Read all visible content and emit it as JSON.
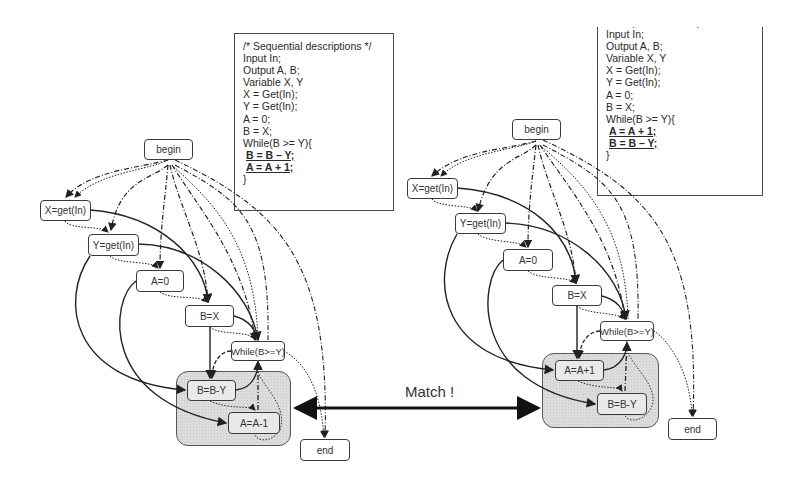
{
  "left": {
    "code": {
      "lines": [
        {
          "text": "/* Sequential descriptions */",
          "highlight": false
        },
        {
          "text": "Input In;",
          "highlight": false
        },
        {
          "text": "Output A, B;",
          "highlight": false
        },
        {
          "text": "Variable X, Y",
          "highlight": false
        },
        {
          "text": "X = Get(In);",
          "highlight": false
        },
        {
          "text": "Y = Get(In);",
          "highlight": false
        },
        {
          "text": "A = 0;",
          "highlight": false
        },
        {
          "text": "B = X;",
          "highlight": false
        },
        {
          "text": "While(B >= Y){",
          "highlight": false
        },
        {
          "text": "B = B – Y;",
          "highlight": true
        },
        {
          "text": "A = A + 1;",
          "highlight": true
        },
        {
          "text": "}",
          "highlight": false
        }
      ]
    },
    "nodes": {
      "begin": "begin",
      "x_get": "X=get(In)",
      "y_get": "Y=get(In)",
      "a0": "A=0",
      "bx": "B=X",
      "while": "While(B>=Y)",
      "bby": "B=B-Y",
      "aa1": "A=A-1",
      "end": "end"
    }
  },
  "right": {
    "code": {
      "lines": [
        {
          "text": "/* Sequential descriptions */",
          "highlight": false
        },
        {
          "text": "Input In;",
          "highlight": false
        },
        {
          "text": "Output A, B;",
          "highlight": false
        },
        {
          "text": "Variable X, Y",
          "highlight": false
        },
        {
          "text": "X = Get(In);",
          "highlight": false
        },
        {
          "text": "Y = Get(In);",
          "highlight": false
        },
        {
          "text": "A = 0;",
          "highlight": false
        },
        {
          "text": "B = X;",
          "highlight": false
        },
        {
          "text": "While(B >= Y){",
          "highlight": false
        },
        {
          "text": "A = A + 1;",
          "highlight": true
        },
        {
          "text": "B = B – Y;",
          "highlight": true
        },
        {
          "text": "}",
          "highlight": false
        }
      ]
    },
    "nodes": {
      "begin": "begin",
      "x_get": "X=get(In)",
      "y_get": "Y=get(In)",
      "a0": "A=0",
      "bx": "B=X",
      "while": "While(B>=Y)",
      "aa1": "A=A+1",
      "bby": "B=B-Y",
      "end": "end"
    }
  },
  "match_label": "Match !",
  "colors": {
    "stroke": "#222222",
    "region_fill": "#dcdcdc",
    "text": "#2a2a2a"
  }
}
